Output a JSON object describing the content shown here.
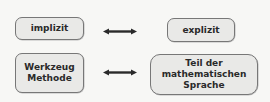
{
  "diagram": {
    "rows": [
      {
        "left": {
          "lines": [
            "implizit"
          ]
        },
        "relation": "bidirectional-arrow",
        "right": {
          "lines": [
            "explizit"
          ]
        }
      },
      {
        "left": {
          "lines": [
            "Werkzeug",
            "Methode"
          ]
        },
        "relation": "bidirectional-arrow",
        "right": {
          "lines": [
            "Teil der",
            "mathematischen",
            "Sprache"
          ]
        }
      }
    ],
    "colors": {
      "box_fill": "#e9e9e7",
      "box_border": "#777777",
      "arrow": "#2a2a2a",
      "text": "#2a2a2a",
      "background": "#f7f7f5"
    }
  }
}
